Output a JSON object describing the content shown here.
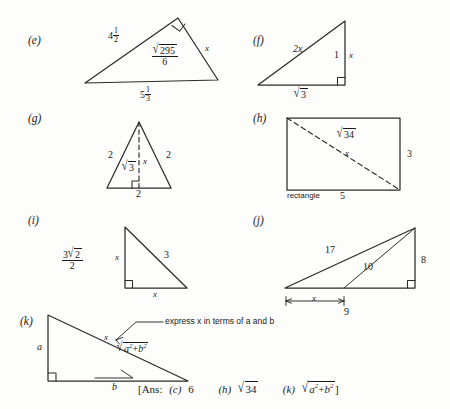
{
  "page": {
    "background": "#fdfdfc",
    "ink": "#1a1a1a",
    "width": 450,
    "height": 409
  },
  "problems": [
    {
      "tag": "(e)",
      "shape": "triangle",
      "note": "right angle at apex",
      "labels": {
        "left_side": "4 1/2",
        "left_side_whole": "4",
        "left_side_num": "1",
        "left_side_den": "2",
        "interior_num": "295",
        "interior_den": "6",
        "right_side": "x",
        "base_whole": "5",
        "base_num": "1",
        "base_den": "3"
      }
    },
    {
      "tag": "(f)",
      "shape": "right-triangle",
      "labels": {
        "hypotenuse": "2x",
        "vertical_inner": "1",
        "vertical_outer": "x",
        "base_radicand": "3"
      }
    },
    {
      "tag": "(g)",
      "shape": "isosceles-triangle",
      "labels": {
        "left_side": "2",
        "right_side": "2",
        "altitude_left_radicand": "3",
        "altitude_right": "x",
        "base": "2"
      }
    },
    {
      "tag": "(h)",
      "shape": "rectangle",
      "labels": {
        "diagonal_radicand": "34",
        "diagonal_var": "x",
        "height": "3",
        "base": "5",
        "caption": "rectangle"
      }
    },
    {
      "tag": "(i)",
      "shape": "right-triangle",
      "labels": {
        "fraction_num_coeff": "3",
        "fraction_num_radicand": "2",
        "fraction_den": "2",
        "vertical": "x",
        "hypotenuse": "3",
        "base": "x"
      }
    },
    {
      "tag": "(j)",
      "shape": "triangle-with-cevian",
      "labels": {
        "long_side": "17",
        "cevian": "10",
        "vertical": "8",
        "dim_x": "x",
        "dim_total": "9"
      }
    },
    {
      "tag": "(k)",
      "shape": "right-triangle",
      "labels": {
        "vertical": "a",
        "hypotenuse_var": "x",
        "hypotenuse_expr_a": "a",
        "hypotenuse_expr_a_exp": "2",
        "hypotenuse_expr_plus": "+",
        "hypotenuse_expr_b": "b",
        "hypotenuse_expr_b_exp": "2",
        "base": "b",
        "callout": "express x in terms of a and b"
      }
    }
  ],
  "answers": {
    "prefix": "[Ans:",
    "entries": [
      {
        "tag": "(c)",
        "value": "6"
      },
      {
        "tag": "(h)",
        "value": "34",
        "is_radical": true
      },
      {
        "tag": "(k)",
        "value": "a2+b2",
        "is_radical": true
      }
    ],
    "suffix": "]"
  }
}
